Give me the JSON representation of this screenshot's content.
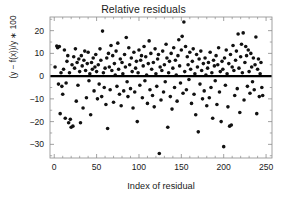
{
  "chart_data": {
    "type": "scatter",
    "title": "Relative residuals",
    "xlabel": "Index of residual",
    "ylabel": "(y − f(x))/y ∗ 100",
    "xlim": [
      -5,
      257
    ],
    "ylim": [
      -36,
      26
    ],
    "xticks": [
      0,
      50,
      100,
      150,
      200,
      250
    ],
    "xticklabels": [
      "0",
      "50",
      "100",
      "150",
      "200",
      "250"
    ],
    "yticks": [
      20,
      10,
      0,
      -10,
      -20,
      -30
    ],
    "yticklabels": [
      "20",
      "10",
      "0",
      "−10",
      "−20",
      "−30"
    ],
    "grid": false,
    "legend": null,
    "marker_color": "#111111",
    "marker_size": 1.8,
    "frame_color": "#8a8a8a",
    "reference_line": {
      "name": "zero-line",
      "orientation": "horizontal",
      "y": 0,
      "color": "#000000",
      "width": 2.2
    },
    "x": [
      1,
      3,
      4,
      5,
      6,
      7,
      8,
      9,
      10,
      11,
      12,
      13,
      14,
      15,
      16,
      17,
      18,
      19,
      20,
      21,
      22,
      23,
      24,
      25,
      26,
      27,
      28,
      29,
      30,
      31,
      32,
      33,
      34,
      35,
      36,
      37,
      38,
      39,
      40,
      41,
      42,
      43,
      44,
      45,
      46,
      47,
      48,
      49,
      50,
      51,
      52,
      53,
      54,
      55,
      56,
      57,
      58,
      59,
      60,
      61,
      62,
      63,
      64,
      65,
      66,
      67,
      68,
      69,
      70,
      71,
      72,
      73,
      74,
      75,
      76,
      77,
      78,
      79,
      80,
      81,
      82,
      83,
      84,
      85,
      86,
      87,
      88,
      89,
      90,
      91,
      92,
      93,
      94,
      95,
      96,
      97,
      98,
      99,
      100,
      101,
      102,
      103,
      104,
      105,
      106,
      107,
      108,
      109,
      110,
      111,
      112,
      113,
      114,
      115,
      116,
      117,
      118,
      119,
      120,
      121,
      122,
      123,
      124,
      125,
      126,
      127,
      128,
      129,
      130,
      131,
      132,
      133,
      134,
      135,
      136,
      137,
      138,
      139,
      140,
      141,
      142,
      143,
      144,
      145,
      146,
      147,
      148,
      149,
      150,
      151,
      152,
      153,
      154,
      155,
      156,
      157,
      158,
      159,
      160,
      161,
      162,
      163,
      164,
      165,
      166,
      167,
      168,
      169,
      170,
      171,
      172,
      173,
      174,
      175,
      176,
      177,
      178,
      179,
      180,
      181,
      182,
      183,
      184,
      185,
      186,
      187,
      188,
      189,
      190,
      191,
      192,
      193,
      194,
      195,
      196,
      197,
      198,
      199,
      200,
      201,
      202,
      203,
      204,
      205,
      206,
      207,
      208,
      209,
      210,
      211,
      212,
      213,
      214,
      215,
      216,
      217,
      218,
      219,
      220,
      221,
      222,
      223,
      224,
      225,
      226,
      227,
      228,
      229,
      230,
      231,
      232,
      233,
      234,
      235,
      236,
      237,
      238,
      239,
      240,
      241,
      242,
      243,
      244,
      245,
      246,
      247,
      248
    ],
    "y": [
      4.0,
      13.2,
      12.5,
      -3.5,
      13.0,
      -16.5,
      1.5,
      -4.5,
      -8.0,
      3.0,
      11.5,
      -18.5,
      -3.0,
      6.5,
      9.0,
      -20.5,
      1.5,
      -19.0,
      -22.5,
      5.0,
      -22.0,
      8.5,
      3.5,
      12.0,
      -11.0,
      6.0,
      -4.0,
      7.5,
      2.0,
      -20.5,
      9.0,
      4.5,
      -14.0,
      7.0,
      11.0,
      2.5,
      -9.5,
      5.5,
      10.5,
      -2.0,
      1.0,
      -17.0,
      6.0,
      3.0,
      8.0,
      -6.5,
      4.0,
      9.5,
      2.0,
      -10.0,
      5.0,
      -3.5,
      12.0,
      7.0,
      -9.0,
      19.8,
      1.5,
      -5.0,
      3.5,
      -12.5,
      8.0,
      -23.0,
      10.0,
      4.0,
      -6.0,
      13.5,
      2.5,
      9.0,
      -11.5,
      5.5,
      0.5,
      11.0,
      -4.5,
      14.5,
      3.0,
      -8.0,
      7.5,
      -13.0,
      6.0,
      1.0,
      -6.5,
      9.5,
      4.0,
      17.0,
      -2.5,
      -9.0,
      12.5,
      5.0,
      -5.5,
      8.0,
      2.0,
      -14.0,
      10.5,
      -7.0,
      3.5,
      6.5,
      -20.0,
      1.5,
      11.5,
      -4.0,
      7.0,
      9.0,
      -9.5,
      4.5,
      13.0,
      -2.0,
      8.5,
      0.5,
      -12.0,
      5.5,
      15.5,
      -6.0,
      10.0,
      3.0,
      -8.5,
      6.0,
      -13.5,
      12.0,
      1.0,
      -4.5,
      7.5,
      9.5,
      -34.0,
      4.0,
      -10.5,
      2.5,
      11.0,
      -7.0,
      5.0,
      -2.5,
      14.0,
      8.0,
      -22.5,
      1.5,
      6.5,
      -9.0,
      10.0,
      -14.5,
      3.5,
      12.5,
      -5.0,
      7.0,
      0.5,
      -11.0,
      9.0,
      16.0,
      4.5,
      -3.0,
      11.5,
      17.5,
      -7.5,
      23.8,
      2.0,
      13.0,
      -6.0,
      8.5,
      5.0,
      -1.5,
      10.5,
      3.0,
      -12.0,
      6.5,
      12.0,
      -8.0,
      1.0,
      -17.0,
      9.5,
      4.0,
      -24.5,
      7.5,
      -3.5,
      11.0,
      2.5,
      -10.0,
      5.5,
      -6.5,
      8.0,
      0.5,
      -13.0,
      3.5,
      6.0,
      -9.5,
      10.5,
      -5.0,
      1.5,
      -18.5,
      7.0,
      4.5,
      -2.0,
      9.0,
      -12.5,
      5.0,
      12.5,
      -7.0,
      2.0,
      -20.0,
      6.5,
      3.0,
      -31.0,
      8.0,
      -4.0,
      11.5,
      1.0,
      -13.5,
      5.5,
      -22.0,
      9.5,
      -21.5,
      4.0,
      13.5,
      2.5,
      -8.5,
      7.0,
      11.0,
      -5.5,
      18.5,
      3.5,
      -16.0,
      8.5,
      14.0,
      1.5,
      19.0,
      -10.5,
      6.0,
      13.0,
      9.0,
      -4.5,
      11.5,
      2.0,
      -7.5,
      10.0,
      4.0,
      -2.5,
      8.0,
      -6.0,
      5.0,
      17.2,
      -16.5,
      3.0,
      7.5,
      -9.0,
      1.0,
      6.0,
      -5.0,
      -8.5
    ]
  }
}
